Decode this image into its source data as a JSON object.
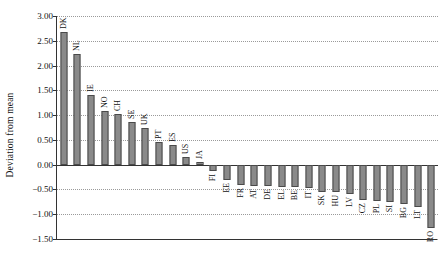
{
  "chart_data": {
    "type": "bar",
    "title": "",
    "xlabel": "",
    "ylabel": "Deviation from mean",
    "ylim": [
      -1.5,
      3.0
    ],
    "ytick_values": [
      3.0,
      2.5,
      2.0,
      1.5,
      1.0,
      0.5,
      0.0,
      -0.5,
      -1.0,
      -1.5
    ],
    "ytick_labels": [
      "3.00",
      "2.50",
      "2.00",
      "1.50",
      "1.00",
      "0.50",
      "0.00",
      "−0.50",
      "−1.00",
      "−1.50"
    ],
    "grid": true,
    "legend": "none",
    "bar_color": "#8a8a8a",
    "bar_edge_color": "#4a4a4a",
    "categories": [
      "DK",
      "NL",
      "IE",
      "NO",
      "CH",
      "SE",
      "UK",
      "PT",
      "ES",
      "US",
      "JA",
      "FI",
      "EE",
      "FR",
      "AT",
      "DE",
      "EL",
      "BE",
      "IT",
      "SK",
      "HU",
      "LV",
      "CZ",
      "PL",
      "SI",
      "BG",
      "LT",
      "RO"
    ],
    "values": [
      2.68,
      2.24,
      1.4,
      1.09,
      1.02,
      0.87,
      0.74,
      0.46,
      0.39,
      0.15,
      0.06,
      -0.12,
      -0.3,
      -0.41,
      -0.43,
      -0.44,
      -0.45,
      -0.46,
      -0.47,
      -0.55,
      -0.56,
      -0.6,
      -0.72,
      -0.74,
      -0.75,
      -0.8,
      -0.86,
      -1.27
    ]
  }
}
